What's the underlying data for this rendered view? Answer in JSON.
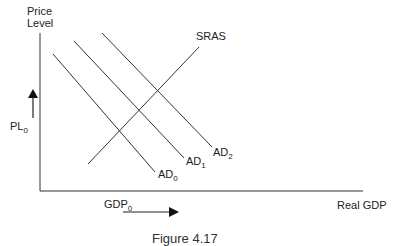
{
  "diagram": {
    "type": "AD-AS model",
    "y_axis_label_line1": "Price",
    "y_axis_label_line2": "Level",
    "x_axis_label": "Real GDP",
    "price_level_label": "PL",
    "price_level_sub": "0",
    "gdp_label": "GDP",
    "gdp_sub": "0",
    "curves": [
      {
        "name": "AD",
        "sub": "0"
      },
      {
        "name": "AD",
        "sub": "1"
      },
      {
        "name": "AD",
        "sub": "2"
      },
      {
        "name": "SRAS",
        "sub": ""
      }
    ],
    "caption": "Figure 4.17",
    "line_color": "#333333",
    "arrow_directions": {
      "price_level": "up",
      "gdp": "right"
    }
  }
}
